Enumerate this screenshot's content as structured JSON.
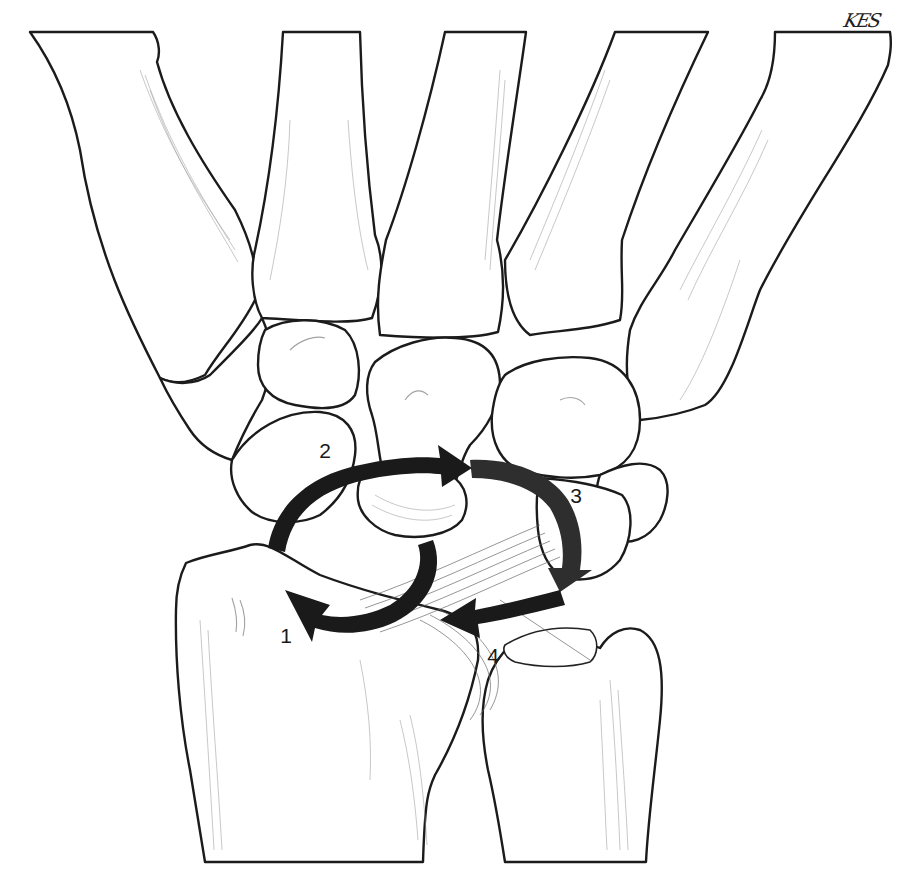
{
  "figure": {
    "type": "anatomical-illustration",
    "signature": "KES",
    "labels": [
      {
        "id": "1",
        "text": "1",
        "x": 286,
        "y": 635
      },
      {
        "id": "2",
        "text": "2",
        "x": 325,
        "y": 450
      },
      {
        "id": "3",
        "text": "3",
        "x": 576,
        "y": 495
      },
      {
        "id": "4",
        "text": "4",
        "x": 493,
        "y": 655
      }
    ],
    "colors": {
      "background": "#ffffff",
      "outline": "#1b1b1b",
      "arrow": "#1a1a1a",
      "shading": "#9a9a9a"
    }
  }
}
